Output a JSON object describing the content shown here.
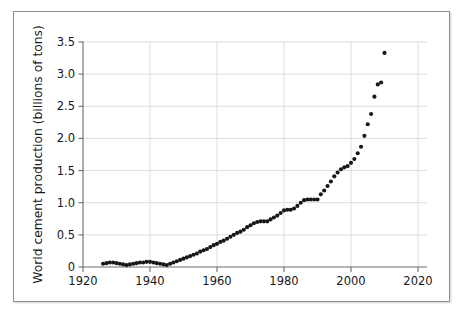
{
  "figure": {
    "background_color": "#ffffff",
    "frame_border_color": "#8e8e8e"
  },
  "chart_data": {
    "type": "scatter",
    "title": "",
    "subtitle": "",
    "xlabel": "",
    "ylabel": "World cement production (billions of tons)",
    "xlim": [
      1920,
      2020
    ],
    "ylim": [
      0,
      3.5
    ],
    "xticks": [
      1920,
      1940,
      1960,
      1980,
      2000,
      2020
    ],
    "xtick_labels": [
      "1920",
      "1940",
      "1960",
      "1980",
      "2000",
      "2020"
    ],
    "yticks": [
      0,
      0.5,
      1.0,
      1.5,
      2.0,
      2.5,
      3.0,
      3.5
    ],
    "ytick_labels": [
      "0",
      "0.5",
      "1.0",
      "1.5",
      "2.0",
      "2.5",
      "3.0",
      "3.5"
    ],
    "grid": true,
    "grid_axis": "y",
    "grid_color": "#d8dadd",
    "legend": null,
    "legend_position": "none",
    "marker": "circle",
    "marker_color": "#16181c",
    "marker_size": 3.0,
    "series": [
      {
        "name": "World cement production",
        "units": "billions of tons",
        "x": [
          1926,
          1927,
          1928,
          1929,
          1930,
          1931,
          1932,
          1933,
          1934,
          1935,
          1936,
          1937,
          1938,
          1939,
          1940,
          1941,
          1942,
          1943,
          1944,
          1945,
          1946,
          1947,
          1948,
          1949,
          1950,
          1951,
          1952,
          1953,
          1954,
          1955,
          1956,
          1957,
          1958,
          1959,
          1960,
          1961,
          1962,
          1963,
          1964,
          1965,
          1966,
          1967,
          1968,
          1969,
          1970,
          1971,
          1972,
          1973,
          1974,
          1975,
          1976,
          1977,
          1978,
          1979,
          1980,
          1981,
          1982,
          1983,
          1984,
          1985,
          1986,
          1987,
          1988,
          1989,
          1990,
          1991,
          1992,
          1993,
          1994,
          1995,
          1996,
          1997,
          1998,
          1999,
          2000,
          2001,
          2002,
          2003,
          2004,
          2005,
          2006,
          2007,
          2008,
          2009,
          2010
        ],
        "y": [
          0.05,
          0.06,
          0.07,
          0.07,
          0.06,
          0.05,
          0.04,
          0.03,
          0.04,
          0.05,
          0.06,
          0.07,
          0.07,
          0.08,
          0.08,
          0.07,
          0.06,
          0.05,
          0.04,
          0.03,
          0.05,
          0.07,
          0.09,
          0.11,
          0.13,
          0.15,
          0.17,
          0.19,
          0.21,
          0.24,
          0.26,
          0.28,
          0.31,
          0.34,
          0.36,
          0.39,
          0.41,
          0.44,
          0.47,
          0.5,
          0.53,
          0.55,
          0.58,
          0.62,
          0.65,
          0.68,
          0.7,
          0.71,
          0.71,
          0.71,
          0.74,
          0.77,
          0.8,
          0.84,
          0.88,
          0.89,
          0.89,
          0.91,
          0.95,
          1.0,
          1.04,
          1.05,
          1.05,
          1.05,
          1.05,
          1.13,
          1.19,
          1.26,
          1.33,
          1.41,
          1.47,
          1.52,
          1.55,
          1.57,
          1.62,
          1.68,
          1.77,
          1.87,
          2.04,
          2.22,
          2.38,
          2.65,
          2.84,
          2.87,
          3.33
        ]
      }
    ]
  }
}
